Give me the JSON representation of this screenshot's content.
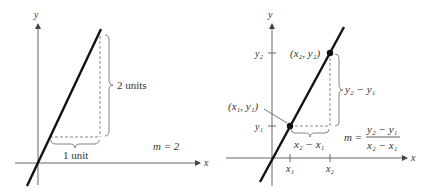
{
  "left_panel": {
    "y_axis_label": "y",
    "x_axis_label": "x",
    "rise_label": "2 units",
    "run_label": "1 unit",
    "slope_label": "m = 2"
  },
  "right_panel": {
    "y_axis_label": "y",
    "x_axis_label": "x",
    "point1_label": "(x₁, y₁)",
    "point2_label": "(x₂, y₂)",
    "y1_tick": "y₁",
    "y2_tick": "y₂",
    "x1_tick": "x₁",
    "x2_tick": "x₂",
    "rise_label": "y₂ − y₁",
    "run_label": "x₂ − x₁",
    "slope_lhs": "m =",
    "slope_numerator": "y₂ − y₁",
    "slope_denominator": "x₂ − x₁"
  },
  "colors": {
    "line": "#111111",
    "axis": "#444444",
    "dashed": "#777777",
    "text": "#333333"
  }
}
